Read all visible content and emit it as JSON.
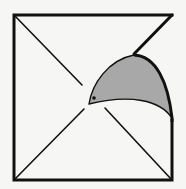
{
  "diagram": {
    "description": "Square with diagonals; top-right corner folded over showing a shaded curved flap",
    "colors": {
      "background": "#f6f6f4",
      "stroke": "#111111",
      "flap_fill": "#a8a8a8"
    },
    "square": {
      "x1": 14,
      "y1": 15,
      "x2": 172,
      "y2": 180
    },
    "center": {
      "x": 93,
      "y": 97
    },
    "flap_tip": {
      "x": 89,
      "y": 104
    }
  }
}
